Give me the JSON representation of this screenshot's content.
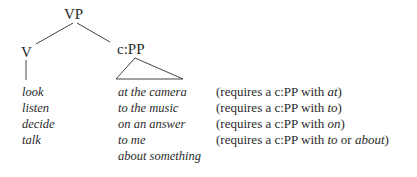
{
  "tree": {
    "root": "VP",
    "left_child": "V",
    "right_child": "c:PP"
  },
  "verbs": [
    "look",
    "listen",
    "decide",
    "talk"
  ],
  "complements": [
    "at the camera",
    "to the music",
    "on an answer",
    "to me",
    "about something"
  ],
  "requirements": [
    {
      "prefix": "(requires a c:PP with ",
      "items": [
        {
          "text": "at",
          "italic": true
        }
      ],
      "suffix": ")"
    },
    {
      "prefix": "(requires a c:PP with ",
      "items": [
        {
          "text": "to",
          "italic": true
        }
      ],
      "suffix": ")"
    },
    {
      "prefix": "(requires a c:PP with ",
      "items": [
        {
          "text": "on",
          "italic": true
        }
      ],
      "suffix": ")"
    },
    {
      "prefix": "(requires a c:PP with ",
      "items": [
        {
          "text": "to",
          "italic": true
        },
        {
          "text": " or ",
          "italic": false
        },
        {
          "text": "about",
          "italic": true
        }
      ],
      "suffix": ")"
    }
  ]
}
